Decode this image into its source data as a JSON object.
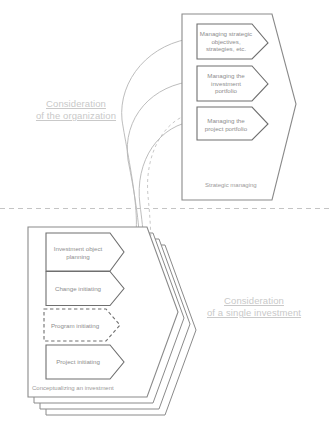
{
  "diagram": {
    "divider": {
      "style": "dashed",
      "color": "#c4c4c4"
    },
    "zones": [
      {
        "id": "organization",
        "label_line1": "Consideration",
        "label_line2": "of the organization"
      },
      {
        "id": "single-investment",
        "label_line1": "Consideration",
        "label_line2": "of a single investment"
      }
    ],
    "top_container": {
      "name": "strategic-managing-container",
      "caption": "Strategic managing",
      "shape": "pentagon",
      "border_color": "#8a8a8a",
      "processes": [
        {
          "id": "p1",
          "line1": "Managing strategic",
          "line2": "objectives,",
          "line3": "strategies, etc."
        },
        {
          "id": "p2",
          "line1": "Managing the",
          "line2": "investment",
          "line3": "portfolio"
        },
        {
          "id": "p3",
          "line1": "Managing the",
          "line2": "project portfolio",
          "line3": ""
        }
      ]
    },
    "bottom_container": {
      "name": "conceptualizing-investment-container",
      "caption": "Conceptualizing an investment",
      "shape": "stacked-pentagon",
      "stack_count": 4,
      "border_color": "#8a8a8a",
      "processes": [
        {
          "id": "b1",
          "line1": "Investment object",
          "line2": "planning",
          "border": "solid"
        },
        {
          "id": "b2",
          "line1": "Change initiating",
          "line2": "",
          "border": "solid"
        },
        {
          "id": "b3",
          "line1": "Program initiating",
          "line2": "",
          "border": "dashed"
        },
        {
          "id": "b4",
          "line1": "Project initiating",
          "line2": "",
          "border": "solid"
        }
      ]
    },
    "connectors": [
      {
        "from": "b1",
        "to": "p1",
        "style": "solid",
        "color": "#b6b6b6"
      },
      {
        "from": "b2",
        "to": "p2",
        "style": "solid",
        "color": "#b6b6b6"
      },
      {
        "from": "b3",
        "to": "p3",
        "style": "dashed",
        "color": "#c0c0c0"
      },
      {
        "from": "b4",
        "to": "p3",
        "style": "solid",
        "color": "#b6b6b6"
      }
    ],
    "footer_caption": ""
  }
}
